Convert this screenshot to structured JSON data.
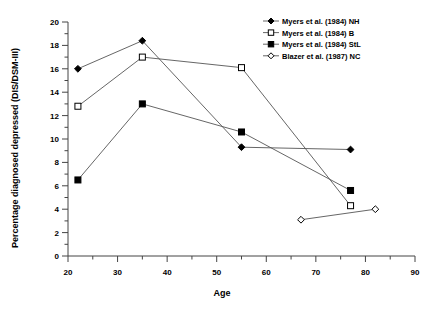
{
  "chart_data": {
    "type": "line",
    "title": "",
    "xlabel": "Age",
    "ylabel": "Percentage diagnosed depressed (DIS/DSM-III)",
    "xlim": [
      20,
      90
    ],
    "ylim": [
      0,
      20
    ],
    "xticks": [
      20,
      30,
      40,
      50,
      60,
      70,
      80,
      90
    ],
    "yticks": [
      0,
      2,
      4,
      6,
      8,
      10,
      12,
      14,
      16,
      18,
      20
    ],
    "xtick_labels": [
      "20",
      "30",
      "40",
      "50",
      "60",
      "70",
      "80",
      "90"
    ],
    "ytick_labels": [
      "0",
      "2",
      "4",
      "6",
      "8",
      "10",
      "12",
      "14",
      "16",
      "18",
      "20"
    ],
    "x_minor_tick_step": 5,
    "y_minor_tick_step": 1,
    "grid": false,
    "legend_position": "top-right",
    "line_color": "#555555",
    "marker_color": "#000000",
    "series": [
      {
        "name": "Myers et al. (1984) NH",
        "marker": "filled-diamond",
        "x": [
          22,
          35,
          55,
          77
        ],
        "values": [
          16.0,
          18.4,
          9.3,
          9.1
        ]
      },
      {
        "name": "Myers et al. (1984) B",
        "marker": "open-square",
        "x": [
          22,
          35,
          55,
          77
        ],
        "values": [
          12.8,
          17.0,
          16.1,
          4.3
        ]
      },
      {
        "name": "Myers et al. (1984) StL",
        "marker": "filled-square",
        "x": [
          22,
          35,
          55,
          77
        ],
        "values": [
          6.5,
          13.0,
          10.6,
          5.6
        ]
      },
      {
        "name": "Blazer et al. (1987) NC",
        "marker": "open-diamond",
        "x": [
          67,
          82
        ],
        "values": [
          3.1,
          4.0
        ]
      }
    ]
  },
  "legend": {
    "items": [
      {
        "label": "Myers et al. (1984) NH"
      },
      {
        "label": "Myers et al. (1984) B"
      },
      {
        "label": "Myers et al. (1984) StL"
      },
      {
        "label": "Blazer et al. (1987) NC"
      }
    ]
  }
}
